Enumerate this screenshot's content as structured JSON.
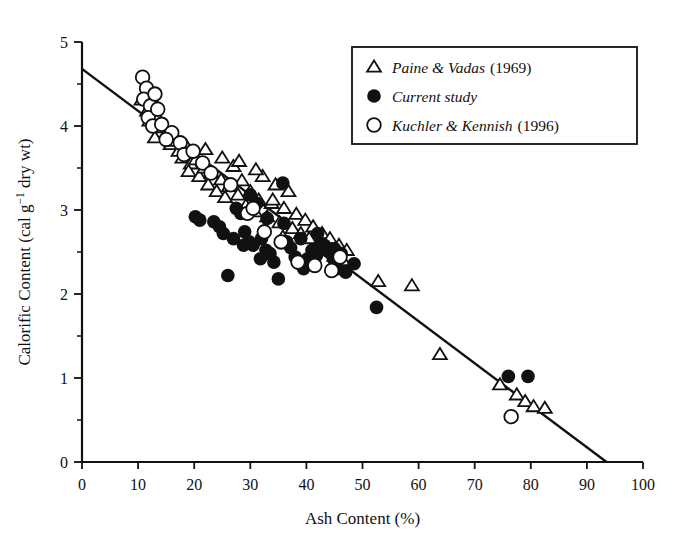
{
  "chart_data": {
    "type": "scatter",
    "title": "",
    "xlabel": "Ash Content (%)",
    "ylabel": "Calorific Content (cal g−1 dry wt)",
    "ylabel_parts": {
      "pre": "Calorific Content (cal g",
      "sup": "−1",
      "post": " dry wt)"
    },
    "xlim": [
      0,
      100
    ],
    "ylim": [
      0,
      5
    ],
    "xticks": [
      0,
      10,
      20,
      30,
      40,
      50,
      60,
      70,
      80,
      90,
      100
    ],
    "yticks": [
      0,
      1,
      2,
      3,
      4,
      5
    ],
    "y_minor_ticks": [
      0.5,
      1.5,
      2.5,
      3.5,
      4.5
    ],
    "grid": false,
    "legend_position": "top-right",
    "marker_color": "#111111",
    "line_color": "#111111",
    "trendline": {
      "label": "regression",
      "x": [
        0,
        93.5
      ],
      "y": [
        4.68,
        0.0
      ],
      "slope": -0.05005,
      "intercept": 4.68
    },
    "series": [
      {
        "name": "Paine & Vadas",
        "year": "(1969)",
        "legend_label": "Paine & Vadas",
        "marker": "open-triangle",
        "points": [
          [
            10.6,
            4.31
          ],
          [
            11.6,
            4.18
          ],
          [
            12.3,
            4.35
          ],
          [
            12.0,
            4.06
          ],
          [
            13.3,
            4.12
          ],
          [
            14.1,
            3.98
          ],
          [
            13.0,
            3.86
          ],
          [
            15.2,
            3.93
          ],
          [
            15.8,
            3.78
          ],
          [
            16.4,
            3.88
          ],
          [
            17.2,
            3.7
          ],
          [
            17.9,
            3.62
          ],
          [
            18.6,
            3.76
          ],
          [
            19.4,
            3.55
          ],
          [
            19.0,
            3.46
          ],
          [
            20.3,
            3.6
          ],
          [
            20.9,
            3.4
          ],
          [
            21.8,
            3.5
          ],
          [
            22.5,
            3.3
          ],
          [
            23.1,
            3.44
          ],
          [
            24.0,
            3.22
          ],
          [
            24.8,
            3.36
          ],
          [
            25.5,
            3.15
          ],
          [
            26.2,
            3.28
          ],
          [
            27.0,
            3.52
          ],
          [
            27.8,
            3.18
          ],
          [
            28.5,
            3.35
          ],
          [
            29.2,
            3.05
          ],
          [
            30.0,
            3.22
          ],
          [
            30.8,
            2.98
          ],
          [
            31.5,
            3.12
          ],
          [
            32.2,
            3.4
          ],
          [
            33.0,
            2.92
          ],
          [
            33.8,
            3.08
          ],
          [
            34.5,
            3.3
          ],
          [
            35.2,
            2.85
          ],
          [
            36.0,
            3.02
          ],
          [
            36.8,
            3.22
          ],
          [
            37.5,
            2.78
          ],
          [
            38.2,
            2.95
          ],
          [
            39.0,
            2.72
          ],
          [
            39.8,
            2.88
          ],
          [
            40.5,
            2.66
          ],
          [
            41.2,
            2.8
          ],
          [
            42.0,
            2.58
          ],
          [
            42.8,
            2.72
          ],
          [
            43.5,
            2.52
          ],
          [
            44.2,
            2.66
          ],
          [
            45.0,
            2.45
          ],
          [
            45.8,
            2.58
          ],
          [
            46.5,
            2.4
          ],
          [
            47.2,
            2.52
          ],
          [
            52.8,
            2.15
          ],
          [
            58.8,
            2.1
          ],
          [
            63.8,
            1.28
          ],
          [
            74.5,
            0.92
          ],
          [
            77.5,
            0.8
          ],
          [
            79.0,
            0.72
          ],
          [
            80.5,
            0.66
          ],
          [
            82.5,
            0.64
          ],
          [
            22.0,
            3.72
          ],
          [
            25.0,
            3.62
          ],
          [
            28.0,
            3.58
          ],
          [
            31.0,
            3.48
          ],
          [
            34.0,
            3.12
          ],
          [
            12.8,
            4.22
          ],
          [
            16.8,
            3.82
          ],
          [
            35.8,
            2.68
          ]
        ]
      },
      {
        "name": "Current study",
        "year": "",
        "legend_label": "Current study",
        "marker": "filled-circle",
        "points": [
          [
            20.2,
            2.92
          ],
          [
            21.0,
            2.88
          ],
          [
            24.5,
            2.8
          ],
          [
            25.2,
            2.72
          ],
          [
            26.0,
            2.22
          ],
          [
            27.5,
            3.02
          ],
          [
            28.3,
            2.96
          ],
          [
            29.0,
            2.74
          ],
          [
            29.8,
            2.62
          ],
          [
            30.5,
            2.58
          ],
          [
            31.2,
            3.08
          ],
          [
            32.0,
            2.66
          ],
          [
            32.8,
            2.52
          ],
          [
            33.5,
            2.48
          ],
          [
            34.2,
            2.38
          ],
          [
            35.0,
            2.18
          ],
          [
            35.8,
            3.32
          ],
          [
            36.5,
            2.62
          ],
          [
            37.2,
            2.55
          ],
          [
            38.0,
            2.44
          ],
          [
            38.8,
            2.36
          ],
          [
            39.5,
            2.3
          ],
          [
            40.2,
            2.42
          ],
          [
            41.0,
            2.52
          ],
          [
            41.8,
            2.46
          ],
          [
            42.5,
            2.6
          ],
          [
            43.2,
            2.58
          ],
          [
            44.0,
            2.5
          ],
          [
            44.8,
            2.42
          ],
          [
            45.5,
            2.3
          ],
          [
            46.2,
            2.48
          ],
          [
            47.0,
            2.26
          ],
          [
            48.5,
            2.36
          ],
          [
            52.5,
            1.84
          ],
          [
            76.0,
            1.02
          ],
          [
            79.5,
            1.02
          ],
          [
            30.0,
            3.18
          ],
          [
            33.0,
            2.9
          ],
          [
            36.0,
            2.84
          ],
          [
            39.0,
            2.66
          ],
          [
            42.0,
            2.72
          ],
          [
            45.0,
            2.54
          ],
          [
            27.0,
            2.66
          ],
          [
            28.8,
            2.58
          ],
          [
            23.5,
            2.86
          ],
          [
            31.8,
            2.42
          ]
        ]
      },
      {
        "name": "Kuchler & Kennish",
        "year": "(1996)",
        "legend_label": "Kuchler & Kennish",
        "marker": "open-circle",
        "points": [
          [
            10.8,
            4.58
          ],
          [
            11.5,
            4.45
          ],
          [
            11.0,
            4.32
          ],
          [
            12.2,
            4.24
          ],
          [
            11.8,
            4.1
          ],
          [
            12.6,
            4.0
          ],
          [
            13.5,
            4.2
          ],
          [
            14.2,
            4.02
          ],
          [
            16.0,
            3.92
          ],
          [
            17.5,
            3.8
          ],
          [
            18.2,
            3.66
          ],
          [
            19.8,
            3.7
          ],
          [
            21.5,
            3.56
          ],
          [
            23.0,
            3.44
          ],
          [
            26.5,
            3.3
          ],
          [
            29.5,
            2.96
          ],
          [
            30.5,
            3.02
          ],
          [
            32.5,
            2.74
          ],
          [
            35.5,
            2.62
          ],
          [
            38.5,
            2.38
          ],
          [
            41.5,
            2.34
          ],
          [
            44.5,
            2.28
          ],
          [
            46.0,
            2.44
          ],
          [
            76.5,
            0.54
          ],
          [
            13.0,
            4.38
          ],
          [
            15.0,
            3.84
          ]
        ]
      }
    ]
  },
  "legend": {
    "items": [
      {
        "marker": "open-triangle",
        "label": "Paine & Vadas",
        "year": "(1969)"
      },
      {
        "marker": "filled-circle",
        "label": "Current study",
        "year": ""
      },
      {
        "marker": "open-circle",
        "label": "Kuchler & Kennish",
        "year": "(1996)"
      }
    ]
  }
}
